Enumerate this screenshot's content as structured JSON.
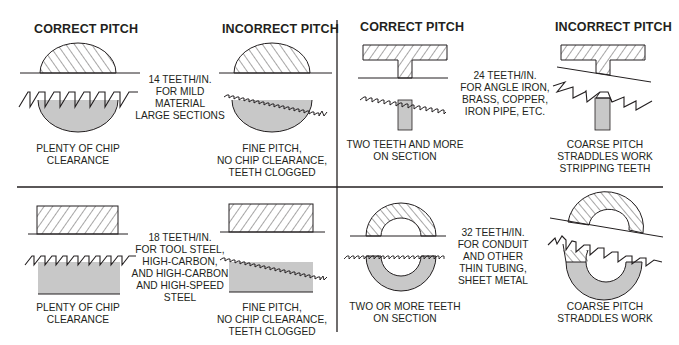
{
  "colors": {
    "ink": "#231f20",
    "gray_fill": "#c8c8c8",
    "background": "#ffffff"
  },
  "panels": [
    {
      "id": "top-left",
      "material": "large-solid-section",
      "correct_title": "CORRECT PITCH",
      "incorrect_title": "INCORRECT PITCH",
      "spec_lines": [
        "14 TEETH/IN.",
        "FOR MILD",
        "MATERIAL",
        "LARGE SECTIONS"
      ],
      "correct_caption": [
        "PLENTY OF CHIP",
        "CLEARANCE"
      ],
      "incorrect_caption": [
        "FINE PITCH,",
        "NO CHIP CLEARANCE,",
        "TEETH CLOGGED"
      ]
    },
    {
      "id": "top-right",
      "material": "angle-iron-section",
      "correct_title": "CORRECT PITCH",
      "incorrect_title": "INCORRECT PITCH",
      "spec_lines": [
        "24 TEETH/IN.",
        "FOR ANGLE IRON,",
        "BRASS, COPPER,",
        "IRON PIPE, ETC."
      ],
      "correct_caption": [
        "TWO TEETH AND MORE",
        "ON SECTION"
      ],
      "incorrect_caption": [
        "COARSE PITCH",
        "STRADDLES WORK",
        "STRIPPING TEETH"
      ]
    },
    {
      "id": "bottom-left",
      "material": "rectangular-bar-section",
      "spec_lines": [
        "18 TEETH/IN.",
        "FOR TOOL STEEL,",
        "HIGH-CARBON,",
        "AND HIGH-CARBON",
        "AND HIGH-SPEED",
        "STEEL"
      ],
      "correct_caption": [
        "PLENTY OF CHIP",
        "CLEARANCE"
      ],
      "incorrect_caption": [
        "FINE PITCH,",
        "NO CHIP CLEARANCE,",
        "TEETH CLOGGED"
      ]
    },
    {
      "id": "bottom-right",
      "material": "thin-tubing-section",
      "spec_lines": [
        "32 TEETH/IN.",
        "FOR CONDUIT",
        "AND OTHER",
        "THIN TUBING,",
        "SHEET METAL"
      ],
      "correct_caption": [
        "TWO OR MORE TEETH",
        "ON SECTION"
      ],
      "incorrect_caption": [
        "COARSE PITCH",
        "STRADDLES WORK"
      ]
    }
  ]
}
